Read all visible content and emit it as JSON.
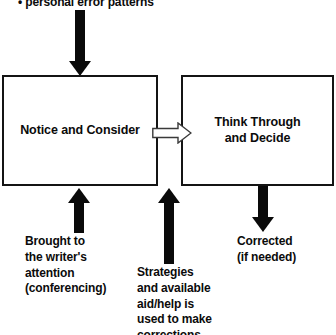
{
  "diagram": {
    "type": "flowchart",
    "background_color": "#ffffff",
    "stroke_color": "#141414",
    "text_color": "#0b0b0b",
    "top_note": "• personal error patterns",
    "boxes": [
      {
        "id": "notice",
        "label": "Notice and Consider"
      },
      {
        "id": "think",
        "label": "Think Through\nand Decide"
      }
    ],
    "captions": [
      {
        "id": "brought",
        "text": "Brought to\nthe writer's\nattention\n(conferencing)"
      },
      {
        "id": "strategies",
        "text": "Strategies\nand available\naid/help is\nused to make\ncorrections."
      },
      {
        "id": "corrected",
        "text": "Corrected\n(if needed)"
      }
    ],
    "arrows": [
      {
        "id": "top-input",
        "direction": "down",
        "style": "solid"
      },
      {
        "id": "notice-to-think",
        "direction": "right",
        "style": "hollow"
      },
      {
        "id": "brought-input",
        "direction": "up",
        "style": "solid"
      },
      {
        "id": "strategies-input",
        "direction": "up",
        "style": "solid"
      },
      {
        "id": "corrected-output",
        "direction": "down",
        "style": "solid"
      }
    ]
  }
}
